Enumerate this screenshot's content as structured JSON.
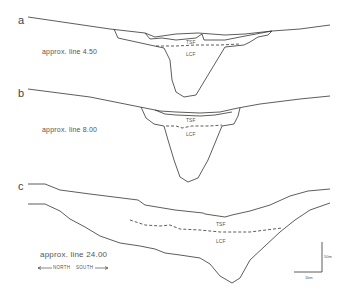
{
  "figure": {
    "panels": [
      {
        "id": "a",
        "label": "a",
        "line": "approx. line 4.50",
        "upper_unit": "TSF",
        "lower_unit": "LCF"
      },
      {
        "id": "b",
        "label": "b",
        "line": "approx. line 8.00",
        "upper_unit": "TSF",
        "lower_unit": "LCF"
      },
      {
        "id": "c",
        "label": "c",
        "line": "approx. line 24.00",
        "upper_unit": "TSF",
        "lower_unit": "LCF"
      }
    ],
    "orientation": {
      "left": "NORTH",
      "right": "SOUTH"
    },
    "scale_bar": {
      "vertical": "50m",
      "horizontal": "1km"
    },
    "colors": {
      "line": "#333333",
      "background": "#ffffff"
    }
  }
}
